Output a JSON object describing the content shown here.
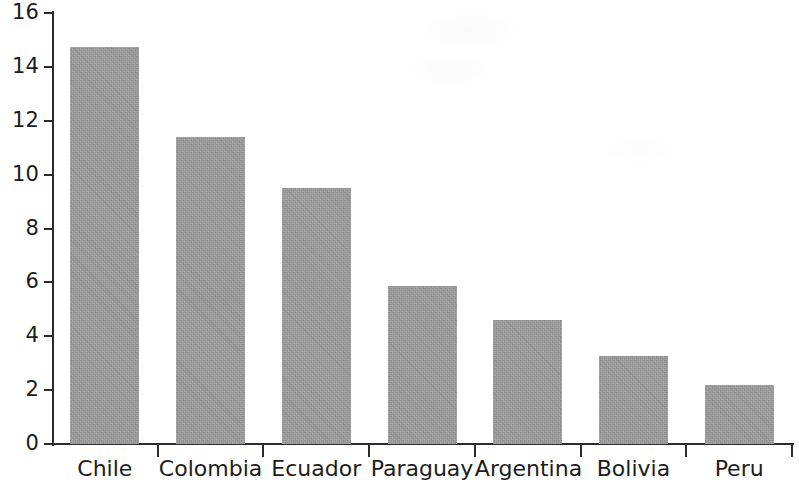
{
  "chart_data": {
    "type": "bar",
    "title": "",
    "subtitle": "",
    "xlabel": "",
    "ylabel": "",
    "categories": [
      "Chile",
      "Colombia",
      "Ecuador",
      "Paraguay",
      "Argentina",
      "Bolivia",
      "Peru"
    ],
    "values": [
      14.75,
      11.4,
      9.5,
      5.85,
      4.6,
      3.25,
      2.2
    ],
    "ylim": [
      0,
      16
    ],
    "ytick_labels": [
      "0",
      "2",
      "4",
      "6",
      "8",
      "10",
      "12",
      "14",
      "16"
    ],
    "ytick_values": [
      0,
      2,
      4,
      6,
      8,
      10,
      12,
      14,
      16
    ],
    "grid": false,
    "legend": false,
    "legend_position": "none",
    "bar_color": "#9b9b9b",
    "axis_color": "#2b2b2b",
    "background_color": "#ffffff"
  }
}
